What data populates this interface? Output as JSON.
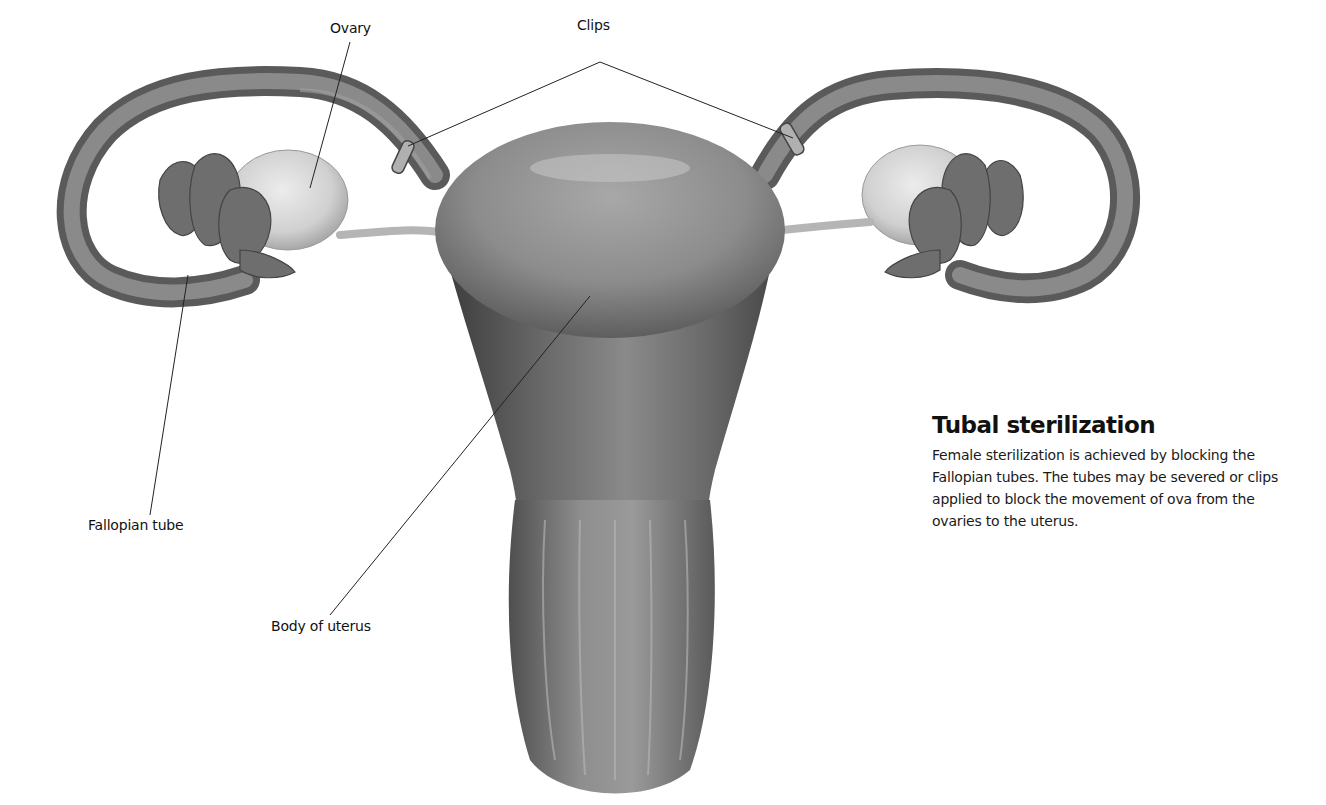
{
  "figure": {
    "labels": {
      "ovary": "Ovary",
      "clips": "Clips",
      "fallopian_tube": "Fallopian tube",
      "body_of_uterus": "Body of uterus"
    }
  },
  "sidebar": {
    "title": "Tubal sterilization",
    "body": "Female sterilization is achieved by blocking the Fallopian tubes. The tubes may be severed or clips applied to block the movement of ova from the ovaries to the uterus."
  },
  "colors": {
    "background": "#ffffff",
    "organ_mid": "#8a8a8a",
    "organ_dark": "#4a4a4a",
    "ovary_light": "#d8d8d8",
    "text": "#111111"
  }
}
